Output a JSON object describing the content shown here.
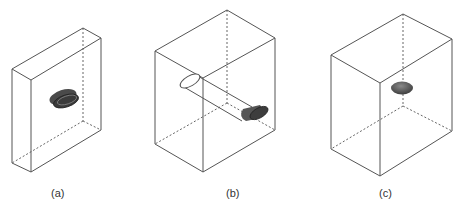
{
  "figure": {
    "panels": [
      {
        "id": "a",
        "caption": "(a)",
        "description": "Thin slab box with a flat shaded ellipsoidal disk at the center",
        "object": "flat-disk",
        "caption_x": 57
      },
      {
        "id": "b",
        "caption": "(b)",
        "description": "Box with an oblique cylinder passing through, ending in a shaded cone cap",
        "object": "cylinder-with-cone",
        "caption_x": 232
      },
      {
        "id": "c",
        "caption": "(c)",
        "description": "Deep box with a small shaded ellipsoid near the center",
        "object": "ellipsoid",
        "caption_x": 385
      }
    ],
    "colors": {
      "edge": "#555555",
      "hidden_edge": "#666666",
      "shaded_object": "#4a4a4a",
      "object_highlight": "#888888",
      "background": "#ffffff"
    }
  }
}
